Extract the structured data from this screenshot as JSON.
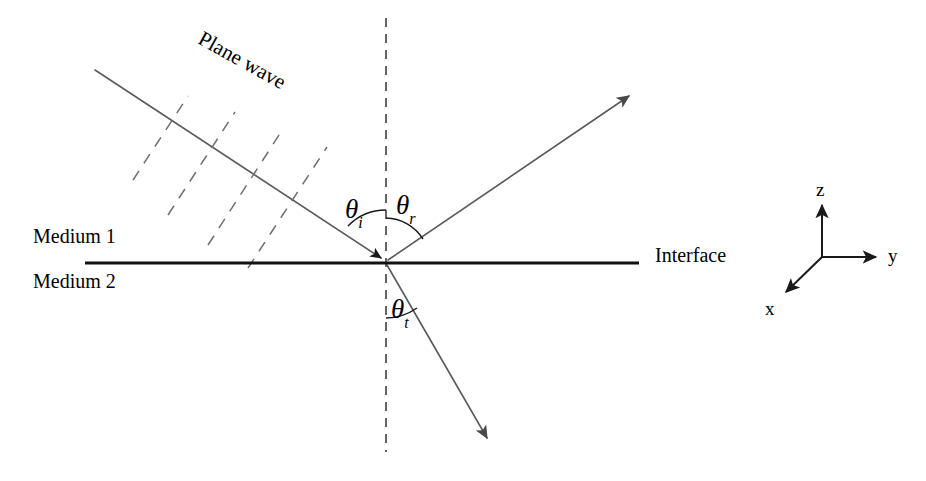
{
  "figure": {
    "background_color": "#ffffff",
    "line_color": "#5a5a5a",
    "interface_color": "#111111",
    "dash_color": "#6e6e73"
  },
  "labels": {
    "plane_wave": "Plane wave",
    "medium_1": "Medium 1",
    "medium_2": "Medium 2",
    "interface": "Interface"
  },
  "angles": {
    "incident": {
      "symbol": "θ",
      "subscript": "i"
    },
    "reflected": {
      "symbol": "θ",
      "subscript": "r"
    },
    "transmitted": {
      "symbol": "θ",
      "subscript": "t"
    }
  },
  "axes": {
    "z": "z",
    "y": "y",
    "x": "x"
  }
}
